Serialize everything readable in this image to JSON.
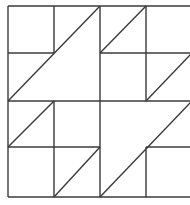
{
  "diagram": {
    "type": "quilt-block",
    "grid": {
      "rows": 4,
      "cols": 4
    },
    "stroke_color": "#3a3a3a",
    "background": "#ffffff",
    "bounds": {
      "x0": 8,
      "y0": 6,
      "x1": 192,
      "y1": 197
    },
    "segments": [
      {
        "name": "outer-top",
        "x1": 8,
        "y1": 6,
        "x2": 192,
        "y2": 6
      },
      {
        "name": "outer-left",
        "x1": 8,
        "y1": 6,
        "x2": 8,
        "y2": 197
      },
      {
        "name": "outer-bottom",
        "x1": 8,
        "y1": 197,
        "x2": 192,
        "y2": 197
      },
      {
        "name": "outer-right",
        "x1": 192,
        "y1": 6,
        "x2": 192,
        "y2": 197
      },
      {
        "name": "center-vertical",
        "x1": 100,
        "y1": 6,
        "x2": 100,
        "y2": 197
      },
      {
        "name": "center-horizontal",
        "x1": 8,
        "y1": 101,
        "x2": 192,
        "y2": 101
      },
      {
        "name": "tl-inner-vertical",
        "x1": 54,
        "y1": 6,
        "x2": 54,
        "y2": 53
      },
      {
        "name": "tl-inner-horizontal",
        "x1": 8,
        "y1": 53,
        "x2": 54,
        "y2": 53
      },
      {
        "name": "tl-big-diagonal",
        "x1": 8,
        "y1": 101,
        "x2": 100,
        "y2": 6
      },
      {
        "name": "tr-inner-vertical",
        "x1": 146,
        "y1": 6,
        "x2": 146,
        "y2": 101
      },
      {
        "name": "tr-inner-horizontal",
        "x1": 100,
        "y1": 53,
        "x2": 192,
        "y2": 53
      },
      {
        "name": "tr-diagonal-a",
        "x1": 100,
        "y1": 53,
        "x2": 146,
        "y2": 6
      },
      {
        "name": "tr-diagonal-b",
        "x1": 146,
        "y1": 101,
        "x2": 192,
        "y2": 53
      },
      {
        "name": "bl-inner-vertical",
        "x1": 54,
        "y1": 101,
        "x2": 54,
        "y2": 197
      },
      {
        "name": "bl-inner-horizontal",
        "x1": 8,
        "y1": 147,
        "x2": 100,
        "y2": 147
      },
      {
        "name": "bl-diagonal-a",
        "x1": 8,
        "y1": 147,
        "x2": 54,
        "y2": 101
      },
      {
        "name": "bl-diagonal-b",
        "x1": 54,
        "y1": 197,
        "x2": 100,
        "y2": 147
      },
      {
        "name": "br-inner-vertical",
        "x1": 146,
        "y1": 147,
        "x2": 146,
        "y2": 197
      },
      {
        "name": "br-inner-horizontal",
        "x1": 146,
        "y1": 147,
        "x2": 192,
        "y2": 147
      },
      {
        "name": "br-big-diagonal",
        "x1": 100,
        "y1": 197,
        "x2": 192,
        "y2": 101
      }
    ]
  }
}
